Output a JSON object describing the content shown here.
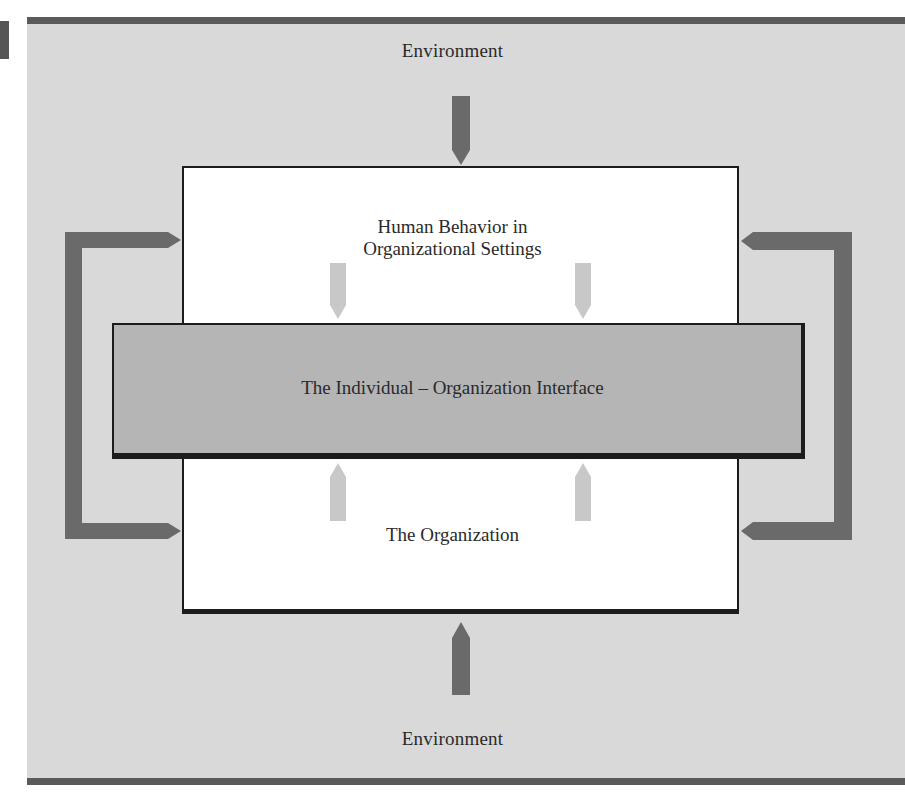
{
  "figure": {
    "environment_top_label": "Environment",
    "environment_bottom_label": "Environment",
    "upper_box": {
      "line1": "Human Behavior in",
      "line2": "Organizational Settings"
    },
    "interface_band": {
      "label": "The Individual – Organization Interface"
    },
    "lower_box": {
      "label": "The Organization"
    },
    "icons": {
      "env_arrow_top": "arrow-down-icon",
      "env_arrow_bottom": "arrow-up-icon",
      "feedback_left": "bracket-arrow-left-icon",
      "feedback_right": "bracket-arrow-right-icon",
      "inner_arrows_down": "arrow-down-icon",
      "inner_arrows_up": "arrow-up-icon"
    },
    "colors": {
      "panel_background": "#d9d9d9",
      "frame_rule": "#5a5a5a",
      "dark_arrow": "#6a6a6a",
      "light_arrow": "#c8c8c8",
      "interface_band": "#b5b5b5",
      "box_fill": "#ffffff",
      "outline": "#1c1c1c",
      "text": "#2a2a2a"
    }
  }
}
